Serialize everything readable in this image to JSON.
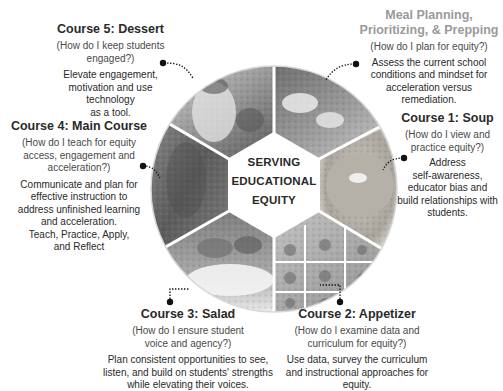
{
  "center": {
    "line1": "SERVING",
    "line2": "EDUCATIONAL",
    "line3": "EQUITY"
  },
  "sections": {
    "meal_planning": {
      "title_line1": "Meal Planning,",
      "title_line2": "Prioritizing, & Prepping",
      "question": "(How do I plan for equity?)",
      "desc_line1": "Assess the current school",
      "desc_line2": "conditions and mindset for",
      "desc_line3": "acceleration versus",
      "desc_line4": "remediation."
    },
    "course1": {
      "title": "Course 1: Soup",
      "question_line1": "(How do I view and",
      "question_line2": "practice equity?)",
      "desc_line1": "Address",
      "desc_line2": "self-awareness,",
      "desc_line3": "educator bias and",
      "desc_line4": "build relationships with",
      "desc_line5": "students."
    },
    "course2": {
      "title": "Course 2: Appetizer",
      "question_line1": "(How do I examine data and",
      "question_line2": "curriculum for equity?)",
      "desc_line1": "Use data, survey the curriculum",
      "desc_line2": "and instructional approaches for",
      "desc_line3": "equity."
    },
    "course3": {
      "title": "Course 3: Salad",
      "question_line1": "(How do I ensure student",
      "question_line2": "voice and agency?)",
      "desc_line1": "Plan consistent opportunities to see,",
      "desc_line2": "listen, and build on students' strengths",
      "desc_line3": "while elevating their voices."
    },
    "course4": {
      "title": "Course 4: Main Course",
      "question_line1": "(How do I teach for equity",
      "question_line2": "access, engagement and",
      "question_line3": "acceleration?)",
      "desc_line1": "Communicate and plan for",
      "desc_line2": "effective instruction to",
      "desc_line3": "address unfinished learning",
      "desc_line4": "and acceleration.",
      "desc_line5": "Teach, Practice, Apply,",
      "desc_line6": "and Reflect"
    },
    "course5": {
      "title": "Course 5: Dessert",
      "question_line1": "(How do I keep students",
      "question_line2": "engaged?)",
      "desc_line1": "Elevate engagement,",
      "desc_line2": "motivation and use technology",
      "desc_line3": "as a tool."
    }
  },
  "segments": [
    {
      "name": "meal-planning-photo",
      "label": "food prep"
    },
    {
      "name": "soup-photo",
      "label": "soup"
    },
    {
      "name": "appetizer-photo",
      "label": "appetizers"
    },
    {
      "name": "salad-photo",
      "label": "salad"
    },
    {
      "name": "main-course-photo",
      "label": "main course"
    },
    {
      "name": "dessert-photo",
      "label": "dessert"
    }
  ],
  "colors": {
    "text": "#2a2a2a",
    "faded_title": "#9a9a9a",
    "connector": "#111111"
  }
}
